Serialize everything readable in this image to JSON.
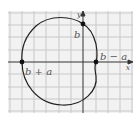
{
  "diagram": {
    "type": "limacon-polar-curve",
    "axes": {
      "x_label": "x",
      "y_label": "y"
    },
    "points": [
      {
        "id": "b_plus_a",
        "label": "b + a"
      },
      {
        "id": "b_minus_a",
        "label": "b − a"
      },
      {
        "id": "b",
        "label": "b"
      }
    ],
    "colors": {
      "background": "#f2f2f2",
      "grid": "#c8c8c8",
      "curve": "#222222",
      "axis": "#333333",
      "label": "#555555"
    }
  }
}
